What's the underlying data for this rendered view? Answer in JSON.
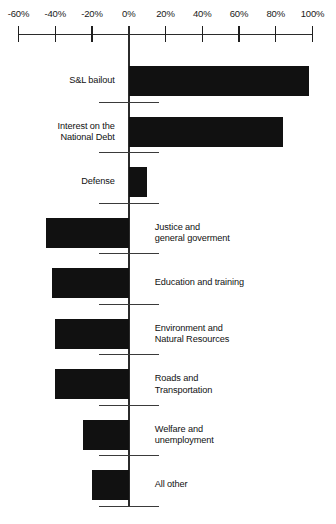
{
  "chart_data": {
    "type": "bar",
    "orientation": "horizontal",
    "title": "",
    "subtitle": "",
    "xlabel": "",
    "ylabel": "",
    "xlim": [
      -60,
      100
    ],
    "grid": false,
    "legend": null,
    "value_unit": "%",
    "axis_ticks": [
      {
        "value": -60,
        "label": "-60%"
      },
      {
        "value": -40,
        "label": "-40%"
      },
      {
        "value": -20,
        "label": "-20%"
      },
      {
        "value": 0,
        "label": "0%"
      },
      {
        "value": 20,
        "label": "20%"
      },
      {
        "value": 40,
        "label": "40%"
      },
      {
        "value": 60,
        "label": "60%"
      },
      {
        "value": 80,
        "label": "80%"
      },
      {
        "value": 100,
        "label": "100%"
      }
    ],
    "categories": [
      "S&L bailout",
      "Interest on the\nNational Debt",
      "Defense",
      "Justice and\ngeneral goverment",
      "Education and training",
      "Environment and\nNatural Resources",
      "Roads and\nTransportation",
      "Welfare and\nunemployment",
      "All other"
    ],
    "values": [
      98,
      84,
      10,
      -45,
      -42,
      -40,
      -40,
      -25,
      -20
    ],
    "bars": [
      {
        "label": "S&L bailout",
        "value": 98,
        "label_side": "left"
      },
      {
        "label": "Interest on the\nNational Debt",
        "value": 84,
        "label_side": "left"
      },
      {
        "label": "Defense",
        "value": 10,
        "label_side": "left"
      },
      {
        "label": "Justice and\ngeneral goverment",
        "value": -45,
        "label_side": "right"
      },
      {
        "label": "Education and training",
        "value": -42,
        "label_side": "right"
      },
      {
        "label": "Environment and\nNatural Resources",
        "value": -40,
        "label_side": "right"
      },
      {
        "label": "Roads and\nTransportation",
        "value": -40,
        "label_side": "right"
      },
      {
        "label": "Welfare and\nunemployment",
        "value": -25,
        "label_side": "right"
      },
      {
        "label": "All other",
        "value": -20,
        "label_side": "right"
      }
    ],
    "colors": {
      "bar": "#111111",
      "axis": "#2b2b2b",
      "text": "#111111",
      "background": "#ffffff"
    }
  }
}
